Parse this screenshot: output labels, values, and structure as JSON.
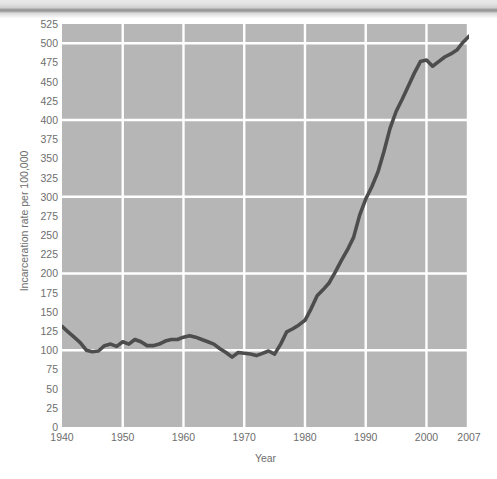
{
  "figure": {
    "background_color": "#ffffff",
    "plot_background_color": "#b6b6b6",
    "gridline_color": "#ffffff",
    "line_color": "#4d4d4d",
    "tick_text_color": "#6e6e6e"
  },
  "axes": {
    "x_title": "Year",
    "y_title": "Incarceration rate per 100,000",
    "y_ticks": [
      "525",
      "500",
      "475",
      "450",
      "425",
      "400",
      "375",
      "350",
      "325",
      "300",
      "275",
      "250",
      "225",
      "200",
      "175",
      "150",
      "125",
      "100",
      "75",
      "50",
      "25",
      "0"
    ],
    "x_ticks": [
      "1940",
      "1950",
      "1960",
      "1970",
      "1980",
      "1990",
      "2000",
      "2007"
    ]
  },
  "chart_data": {
    "type": "line",
    "title": "",
    "subtitle": "",
    "xlabel": "Year",
    "ylabel": "Incarceration rate per 100,000",
    "xlim": [
      1940,
      2007
    ],
    "ylim": [
      0,
      525
    ],
    "ytick_interval": 25,
    "ytick_values": [
      0,
      25,
      50,
      75,
      100,
      125,
      150,
      175,
      200,
      225,
      250,
      275,
      300,
      325,
      350,
      375,
      400,
      425,
      450,
      475,
      500,
      525
    ],
    "xtick_values": [
      1940,
      1950,
      1960,
      1970,
      1980,
      1990,
      2000,
      2007
    ],
    "major_gridlines_y": [
      100,
      200,
      300,
      400,
      500
    ],
    "major_gridlines_x": [
      1940,
      1950,
      1960,
      1970,
      1980,
      1990,
      2000,
      2007
    ],
    "grid": true,
    "legend": false,
    "legend_position": "none",
    "annotations": [],
    "series": [
      {
        "name": "Incarceration rate per 100,000",
        "color": "#4d4d4d",
        "x": [
          1940,
          1941,
          1942,
          1943,
          1944,
          1945,
          1946,
          1947,
          1948,
          1949,
          1950,
          1951,
          1952,
          1953,
          1954,
          1955,
          1956,
          1957,
          1958,
          1959,
          1960,
          1961,
          1962,
          1963,
          1964,
          1965,
          1966,
          1967,
          1968,
          1969,
          1970,
          1971,
          1972,
          1973,
          1974,
          1975,
          1976,
          1977,
          1978,
          1979,
          1980,
          1981,
          1982,
          1983,
          1984,
          1985,
          1986,
          1987,
          1988,
          1989,
          1990,
          1991,
          1992,
          1993,
          1994,
          1995,
          1996,
          1997,
          1998,
          1999,
          2000,
          2001,
          2002,
          2003,
          2004,
          2005,
          2006,
          2007
        ],
        "values": [
          131,
          124,
          117,
          110,
          100,
          98,
          99,
          106,
          108,
          105,
          111,
          108,
          114,
          111,
          106,
          106,
          108,
          112,
          114,
          114,
          117,
          119,
          117,
          114,
          111,
          108,
          102,
          97,
          91,
          97,
          96,
          95,
          93,
          96,
          99,
          95,
          108,
          124,
          128,
          133,
          139,
          154,
          171,
          179,
          188,
          202,
          217,
          231,
          247,
          276,
          297,
          313,
          332,
          359,
          389,
          411,
          427,
          444,
          461,
          476,
          478,
          470,
          476,
          482,
          486,
          491,
          501,
          509
        ]
      }
    ]
  }
}
